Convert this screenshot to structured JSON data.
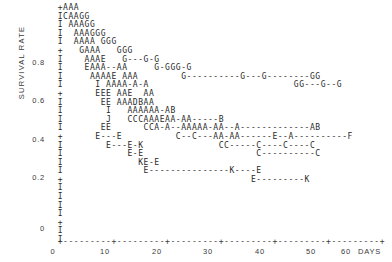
{
  "chart_data": {
    "type": "line",
    "title": "",
    "xlabel": "DAYS",
    "ylabel": "SURVIVAL RATE",
    "xlim": [
      0,
      62
    ],
    "ylim": [
      0,
      0.92
    ],
    "grid": false,
    "legend": "none",
    "x_tick_labels": [
      "0",
      "10",
      "20",
      "30",
      "40",
      "50",
      "60"
    ],
    "x_tick_values": [
      0,
      10,
      20,
      30,
      40,
      50,
      60
    ],
    "y_tick_labels": [
      "0.8",
      "0.6",
      "0.4",
      "0.2",
      "0"
    ],
    "y_tick_values": [
      0.8,
      0.6,
      0.4,
      0.2,
      0
    ],
    "x_unit_label": "DAYS",
    "axis_chars": {
      "vertical": "I",
      "tick": "+",
      "dash": "-"
    },
    "plot_rows": [
      "  +AAA",
      "  ICAAGG",
      "  I AAAGG",
      "  I  AAAGGG",
      "  I  AAAA GGG",
      "  +   GAAA   GGG",
      "  I    AAAE   G---G-G",
      "  I    EAAA--AA     G-GGG-G",
      "  I     AAAAE AAA        G----------G---G--------GG",
      "  I      I AAAA-A-A                           GG---G--G",
      "  +      EEE AAE  AA",
      "  I       EE AAADBAA",
      "  I        I   AAAAAA-AB",
      "  I        J   CCCAAAEAA-AA-----B",
      "  I       EE      CCA-A--AAAAA-AA--A-------------AB",
      "  +      E---E          C--C---AA-AA------E--A----------F",
      "  I        E---E-K              CC-----C----C----C",
      "  I            E-E                     C----------C",
      "  I              KE-E",
      "  I               E---------------K----E",
      "  +                                   E---------K",
      "  I",
      "  I",
      "  I",
      "  I",
      "  +",
      "  I",
      "  I"
    ],
    "x_axis_row": "  +---------+---------+---------+---------+---------+---------+",
    "series": [
      {
        "name": "A",
        "marker": "A",
        "description": "highest survival group, declines from ~0.90 to ~0.40 by day 30"
      },
      {
        "name": "B",
        "marker": "B",
        "description": "few points near 0.45 between days 22 and 34"
      },
      {
        "name": "C",
        "marker": "C",
        "description": "mid-low group, ~0.45 down to ~0.38 out to day 52"
      },
      {
        "name": "D",
        "marker": "D",
        "description": "single point near 0.52 around day 13"
      },
      {
        "name": "E",
        "marker": "E",
        "description": "lower group, ~0.50 falling to ~0.22 by day 46"
      },
      {
        "name": "F",
        "marker": "F",
        "description": "terminal point near 0.40 at day 59"
      },
      {
        "name": "G",
        "marker": "G",
        "description": "high group, ~0.84 down to ~0.68 out to day 57"
      },
      {
        "name": "I",
        "marker": "I",
        "description": "isolated points near 0.62 and 0.48"
      },
      {
        "name": "J",
        "marker": "J",
        "description": "single point near 0.46 at day 11"
      },
      {
        "name": "K",
        "marker": "K",
        "description": "lowest group, ~0.26 down to ~0.22 by day 51"
      }
    ]
  },
  "y_ticks": [
    {
      "label": "0.8",
      "top": 58
    },
    {
      "label": "0.6",
      "top": 96
    },
    {
      "label": "0.4",
      "top": 135
    },
    {
      "label": "0.2",
      "top": 173
    },
    {
      "label": "0",
      "top": 224
    }
  ],
  "x_ticks": [
    {
      "label": "0",
      "left": 53
    },
    {
      "label": "10",
      "left": 105
    },
    {
      "label": "20",
      "left": 157
    },
    {
      "label": "30",
      "left": 208
    },
    {
      "label": "40",
      "left": 260
    },
    {
      "label": "50",
      "left": 311
    },
    {
      "label": "60",
      "left": 346
    }
  ]
}
